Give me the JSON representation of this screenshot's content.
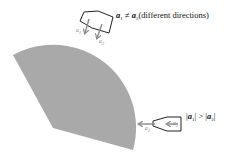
{
  "diagram": {
    "type": "vector-direction-comparison",
    "sector": {
      "fill": "#a9a9a9",
      "description": "gray circular sector (curved path region)"
    },
    "top_case": {
      "arrow_labels": [
        "a",
        "a"
      ],
      "arrow_subscripts": [
        "1",
        "2"
      ],
      "relation": {
        "lhs": "a",
        "lhs_sub": "1",
        "op": "≠",
        "rhs": "a",
        "rhs_sub": "2",
        "note": "(different directions)"
      }
    },
    "right_case": {
      "arrow_labels": [
        "a",
        "a"
      ],
      "arrow_subscripts": [
        "1",
        "2"
      ],
      "relation": {
        "lhs_open": "|",
        "lhs": "a",
        "lhs_sub": "1",
        "lhs_close": "|",
        "op": ">",
        "rhs_open": "|",
        "rhs": "a",
        "rhs_sub": "2",
        "rhs_close": "|"
      }
    },
    "colors": {
      "arrow": "#8a8a8a",
      "outline": "#222222",
      "sector": "#a9a9a9"
    }
  }
}
